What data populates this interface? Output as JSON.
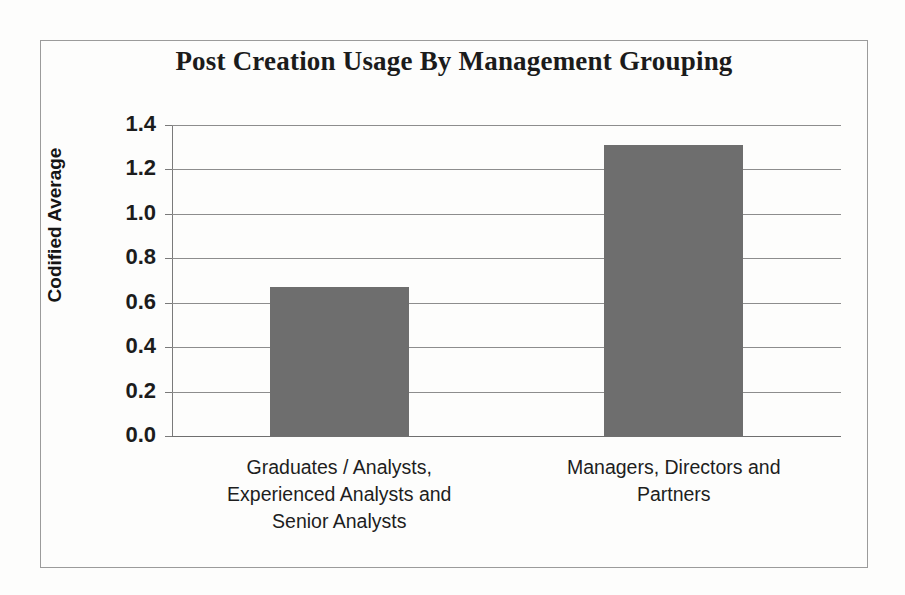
{
  "chart_data": {
    "type": "bar",
    "title": "Post Creation Usage By Management Grouping",
    "xlabel": "",
    "ylabel": "Codified Average",
    "categories": [
      "Graduates / Analysts, Experienced Analysts and Senior Analysts",
      "Managers, Directors and Partners"
    ],
    "category_lines": [
      [
        "Graduates / Analysts,",
        "Experienced Analysts and",
        "Senior Analysts"
      ],
      [
        "Managers, Directors and",
        "Partners"
      ]
    ],
    "values": [
      0.67,
      1.31
    ],
    "ylim": [
      0.0,
      1.4
    ],
    "ytick_labels": [
      "1.4",
      "1.2",
      "1.0",
      "0.8",
      "0.6",
      "0.4",
      "0.2",
      "0.0"
    ],
    "ytick_values": [
      1.4,
      1.2,
      1.0,
      0.8,
      0.6,
      0.4,
      0.2,
      0.0
    ],
    "grid": true,
    "legend": false,
    "legend_position": "none",
    "bar_color": "#6e6e6e",
    "gridline_color": "#8d8d8d",
    "axis_color": "#7a7a7a",
    "frame_color": "#9b9b9b",
    "background_color": "#fdfdfc",
    "text_color": "#1b1b1b"
  }
}
